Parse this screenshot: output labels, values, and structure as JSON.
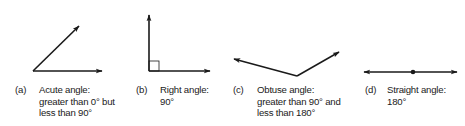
{
  "figures": [
    {
      "id": "a",
      "label": "(a)",
      "name": "Acute angle",
      "lines": [
        "Acute angle:",
        "greater than 0° but",
        "less than 90°"
      ]
    },
    {
      "id": "b",
      "label": "(b)",
      "name": "Right angle",
      "lines": [
        "Right angle:",
        "90°"
      ]
    },
    {
      "id": "c",
      "label": "(c)",
      "name": "Obtuse angle",
      "lines": [
        "Obtuse angle:",
        "greater than 90° and",
        "less than 180°"
      ]
    },
    {
      "id": "d",
      "label": "(d)",
      "name": "Straight angle",
      "lines": [
        "Straight angle:",
        "180°"
      ]
    }
  ],
  "colors": {
    "stroke": "#1a1a1a",
    "background": "#ffffff"
  }
}
